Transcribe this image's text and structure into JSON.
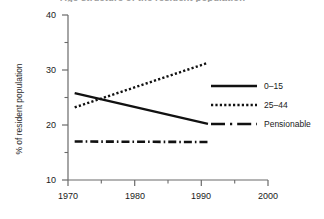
{
  "chart_data": {
    "type": "line",
    "title": "Age structure of the resident population",
    "xlabel": "",
    "ylabel": "% of resident population",
    "xlim": [
      1970,
      2000
    ],
    "ylim": [
      10,
      40
    ],
    "x_ticks": [
      1970,
      1980,
      1990,
      2000
    ],
    "x_minor_ticks": [
      1975,
      1985,
      1995
    ],
    "y_ticks": [
      10,
      20,
      30,
      40
    ],
    "y_minor_ticks": [
      15,
      25,
      35
    ],
    "grid": false,
    "legend_position": "right",
    "series": [
      {
        "name": "0–15",
        "style": "solid",
        "color": "#111111",
        "x": [
          1971,
          1991
        ],
        "values": [
          25.8,
          20.2
        ]
      },
      {
        "name": "25–44",
        "style": "dotted",
        "color": "#111111",
        "x": [
          1971,
          1991
        ],
        "values": [
          23.2,
          31.3
        ]
      },
      {
        "name": "Pensionable",
        "style": "dash-dot",
        "color": "#111111",
        "x": [
          1971,
          1991
        ],
        "values": [
          17.0,
          16.9
        ]
      }
    ]
  },
  "axes": {
    "y_title": "% of resident population",
    "y_labels": [
      "40",
      "30",
      "20",
      "10"
    ],
    "x_labels": [
      "1970",
      "1980",
      "1990",
      "2000"
    ]
  },
  "legend": {
    "items": [
      {
        "label": "0–15"
      },
      {
        "label": "25–44"
      },
      {
        "label": "Pensionable"
      }
    ]
  },
  "colors": {
    "ink": "#111111",
    "axis": "#6a6a6a",
    "title_ghost": "#9a9a9a"
  }
}
